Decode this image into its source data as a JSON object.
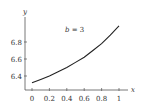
{
  "chart_data": {
    "type": "line",
    "title": "",
    "annotation": "b = 3",
    "xlabel": "x",
    "ylabel": "y",
    "x": [
      0,
      0.1,
      0.2,
      0.3,
      0.4,
      0.5,
      0.6,
      0.7,
      0.8,
      0.9,
      1.0
    ],
    "series": [
      {
        "name": "b = 3",
        "values": [
          6.32,
          6.36,
          6.4,
          6.45,
          6.5,
          6.56,
          6.62,
          6.7,
          6.78,
          6.88,
          6.99
        ]
      }
    ],
    "xticks": [
      "0",
      "0.2",
      "0.4",
      "0.6",
      "0.8",
      "1"
    ],
    "yticks": [
      "6.4",
      "6.6",
      "6.8"
    ],
    "xlim": [
      0,
      1
    ],
    "ylim": [
      6.25,
      7.05
    ],
    "grid": false,
    "legend": "none",
    "colors": {
      "line": "#222222",
      "axis": "#555555",
      "text": "#333333"
    }
  }
}
